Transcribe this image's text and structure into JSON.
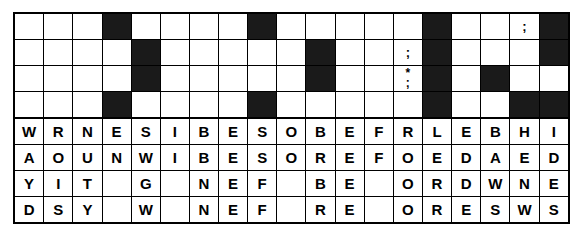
{
  "puzzle": {
    "type": "word-grid-puzzle",
    "columns": 19,
    "clue_rows": 4,
    "letter_rows": 4,
    "colors": {
      "ink": "#000000",
      "block": "#1a1a1a",
      "paper": "#ffffff"
    },
    "clue_grid": [
      [
        "",
        "",
        "",
        "#",
        "",
        "",
        "",
        "",
        "#",
        "",
        "",
        "",
        "",
        "",
        "#",
        "",
        "",
        ";",
        "#"
      ],
      [
        "",
        "",
        "",
        "",
        "#",
        "",
        "",
        "",
        "",
        "",
        "#",
        "",
        "",
        ";",
        "#",
        "",
        "",
        "",
        "#"
      ],
      [
        "",
        "",
        "",
        "",
        "#",
        "",
        "",
        "",
        "",
        "",
        "#",
        "",
        "",
        "*;",
        "#",
        "",
        "#",
        "",
        ""
      ],
      [
        "",
        "",
        "",
        "#",
        "",
        "",
        "",
        "",
        "#",
        "",
        "",
        "",
        "",
        "",
        "#",
        "",
        "",
        "#",
        "#"
      ]
    ],
    "letter_grid": [
      [
        "W",
        "R",
        "N",
        "E",
        "S",
        "I",
        "B",
        "E",
        "S",
        "O",
        "B",
        "E",
        "F",
        "R",
        "L",
        "E",
        "",
        "B",
        "H",
        "I",
        "E",
        "L",
        "E"
      ],
      [
        "A",
        "O",
        "U",
        "N",
        "W",
        "I",
        "B",
        "E",
        "S",
        "O",
        "R",
        "E",
        "F",
        "O",
        "E",
        "D",
        "",
        "A",
        "E",
        "D",
        "T",
        "E",
        ""
      ],
      [
        "Y",
        "I",
        "T",
        "",
        "G",
        "",
        "N",
        "E",
        "F",
        "",
        "B",
        "E",
        "",
        "O",
        "R",
        "D",
        "",
        "W",
        "N",
        "E",
        "T",
        "T",
        ""
      ],
      [
        "D",
        "S",
        "Y",
        "",
        "W",
        "",
        "N",
        "E",
        "F",
        "",
        "R",
        "E",
        "",
        "O",
        "R",
        "E",
        "",
        "S",
        "W",
        "S",
        "",
        "",
        ""
      ]
    ],
    "columns_data": [
      {
        "index": 0,
        "letters": [
          "W",
          "A",
          "Y",
          "D"
        ]
      },
      {
        "index": 1,
        "letters": [
          "R",
          "O",
          "I",
          "S"
        ]
      },
      {
        "index": 2,
        "letters": [
          "N",
          "U",
          "T",
          "Y"
        ]
      },
      {
        "index": 3,
        "letters": [
          "E",
          "N",
          "",
          ""
        ]
      },
      {
        "index": 4,
        "letters": [
          "S",
          "W",
          "G",
          "W"
        ]
      },
      {
        "index": 5,
        "letters": [
          "I",
          "I",
          "",
          ""
        ]
      },
      {
        "index": 6,
        "letters": [
          "B",
          "B",
          "N",
          "N"
        ]
      },
      {
        "index": 7,
        "letters": [
          "E",
          "E",
          "E",
          "E"
        ]
      },
      {
        "index": 8,
        "letters": [
          "S",
          "S",
          "F",
          "F"
        ]
      },
      {
        "index": 9,
        "letters": [
          "O",
          "O",
          "",
          ""
        ]
      },
      {
        "index": 10,
        "letters": [
          "B",
          "R",
          "B",
          "R"
        ]
      },
      {
        "index": 11,
        "letters": [
          "E",
          "E",
          "E",
          "E"
        ]
      },
      {
        "index": 12,
        "letters": [
          "F",
          "F",
          "",
          ""
        ]
      },
      {
        "index": 13,
        "letters": [
          "R",
          "O",
          "O",
          "O"
        ]
      },
      {
        "index": 14,
        "letters": [
          "L",
          "E",
          "R",
          "R"
        ]
      },
      {
        "index": 15,
        "letters": [
          "E",
          "D",
          "D",
          "E"
        ]
      },
      {
        "index": 16,
        "letters": [
          "",
          "",
          "",
          ""
        ]
      },
      {
        "index": 17,
        "letters": [
          "B",
          "A",
          "W",
          "S"
        ]
      },
      {
        "index": 18,
        "letters": [
          "H",
          "E",
          "N",
          "W"
        ]
      },
      {
        "index": 19,
        "letters": [
          "I",
          "D",
          "E",
          "S"
        ]
      },
      {
        "index": 20,
        "letters": [
          "E",
          "T",
          "T",
          ""
        ]
      },
      {
        "index": 21,
        "letters": [
          "L",
          "E",
          "T",
          ""
        ]
      },
      {
        "index": 22,
        "letters": [
          "E",
          "",
          "",
          ""
        ]
      }
    ],
    "marks": {
      "semicolon": ";",
      "asterisk_semicolon_top": "*",
      "asterisk_semicolon_bottom": ";"
    }
  }
}
